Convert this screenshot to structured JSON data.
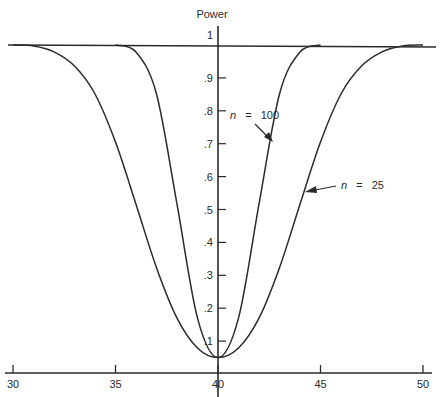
{
  "chart_data": {
    "type": "line",
    "title": "",
    "xlabel": "",
    "ylabel": "Power",
    "xlim": [
      30,
      50
    ],
    "ylim": [
      0,
      1
    ],
    "grid": false,
    "legend": "none (curves annotated with arrows)",
    "x_ticks": [
      "30",
      "35",
      "40",
      "45",
      "50"
    ],
    "y_ticks": [
      ".1",
      ".2",
      ".3",
      ".4",
      ".5",
      ".6",
      ".7",
      ".8",
      ".9",
      "1"
    ],
    "reference_line": {
      "y": 1,
      "label": "1"
    },
    "annotations": [
      {
        "text": "n = 100",
        "points_to": {
          "x": 43.0,
          "y": 0.71
        }
      },
      {
        "text": "n = 25",
        "points_to": {
          "x": 44.6,
          "y": 0.56
        }
      }
    ],
    "x": [
      30,
      31,
      32,
      33,
      34,
      35,
      36,
      37,
      38,
      39,
      40,
      41,
      42,
      43,
      44,
      45,
      46,
      47,
      48,
      49,
      50
    ],
    "series": [
      {
        "name": "n = 100",
        "values": [
          1.0,
          1.0,
          1.0,
          1.0,
          1.0,
          1.0,
          0.979,
          0.851,
          0.516,
          0.17,
          0.05,
          0.17,
          0.516,
          0.851,
          0.979,
          1.0,
          1.0,
          1.0,
          1.0,
          1.0,
          1.0
        ]
      },
      {
        "name": "n = 25",
        "values": [
          1.0,
          0.997,
          0.979,
          0.936,
          0.851,
          0.705,
          0.516,
          0.323,
          0.17,
          0.079,
          0.05,
          0.079,
          0.17,
          0.323,
          0.516,
          0.705,
          0.851,
          0.936,
          0.979,
          0.997,
          1.0
        ]
      }
    ]
  },
  "labels": {
    "y_axis_title": "Power",
    "n100": {
      "var": "n",
      "eq": "=",
      "val": "100"
    },
    "n25": {
      "var": "n",
      "eq": "=",
      "val": "25"
    }
  }
}
